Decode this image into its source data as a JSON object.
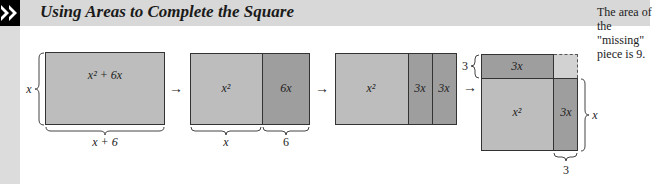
{
  "header": {
    "title": "Using Areas to Complete the Square",
    "logo_icon": "double-chevron-right-icon"
  },
  "colors": {
    "light_region": "#bdbdbd",
    "dark_region": "#9e9e9e",
    "missing_region": "#d2d2d2",
    "header_band": "#d8d8d8",
    "outline": "#333333"
  },
  "step1": {
    "area_label": "x² + 6x",
    "side_label": "x",
    "bottom_label": "x + 6"
  },
  "step2": {
    "left_label": "x²",
    "right_label": "6x",
    "bottom_left_label": "x",
    "bottom_right_label": "6"
  },
  "step3": {
    "main_label": "x²",
    "strip1_label": "3x",
    "strip2_label": "3x"
  },
  "step4": {
    "top_strip_label": "3x",
    "main_label": "x²",
    "right_strip_label": "3x",
    "left_brace_label": "3",
    "right_brace_label": "x",
    "bottom_brace_label": "3"
  },
  "arrows": [
    "→",
    "→",
    "→"
  ],
  "note": {
    "line1": "The area of",
    "line2": "the \"missing\"",
    "line3": "piece is 9."
  }
}
